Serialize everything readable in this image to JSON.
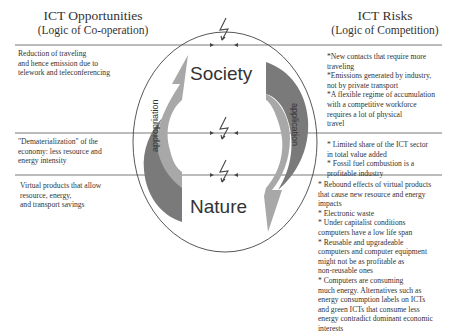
{
  "left_header": {
    "title": "ICT Opportunities",
    "subtitle": "(Logic of Co-operation)"
  },
  "right_header": {
    "title": "ICT Risks",
    "subtitle": "(Logic of Competition)"
  },
  "center": {
    "top_label": "Society",
    "bottom_label": "Nature",
    "left_arrow_label": "appropriation",
    "right_arrow_label": "application",
    "conflict_icon": "lightning-bolt"
  },
  "opportunities": [
    "Reduction of traveling\nand hence emission due to\ntelework and teleconferencing",
    "\"Dematerialization\" of the\neconomy: less resource and\nenergy intensity",
    "Virtual products that allow\nresource, energy,\nand transport savings"
  ],
  "risks": [
    "*New contacts that require more\ntraveling\n*Emissions generated by industry,\nnot by private transport\n*A flexible regime of accumulation\nwith a competitive workforce\nrequires a lot of physical\ntravel",
    "* Limited share of the ICT sector\nin total value added\n* Fossil fuel combustion is a\nprofitable industry",
    "* Rebound effects of virtual products\nthat cause new resource and energy\nimpacts\n* Electronic waste\n* Under capitalist conditions\ncomputers have a low life span\n* Reusable and upgradeable\ncomputers and computer equipment\nmight not be as profitable as\nnon-reusable ones\n* Computers are consuming\nmuch energy. Alternatives such as\nenergy consumption labels on ICTs\nand green ICTs that consume less\nenergy contradict dominant economic\ninterests"
  ],
  "colors": {
    "arrow_dark": "#7a7a7a",
    "arrow_light": "#a8a8a8",
    "line": "#555555"
  }
}
